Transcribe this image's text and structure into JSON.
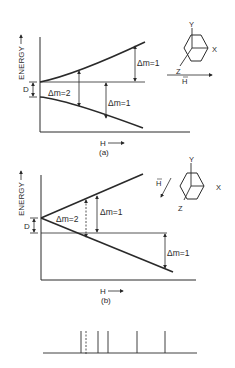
{
  "figure": {
    "panel_a": {
      "y_axis_label": "ENERGY",
      "x_axis_label": "H",
      "caption": "(a)",
      "splitting_label": "D",
      "transitions": [
        {
          "label": "Δm=2",
          "style": "solid"
        },
        {
          "label": "Δm=1",
          "style": "solid"
        },
        {
          "label": "Δm=1",
          "style": "solid"
        }
      ],
      "orientation": {
        "axes": [
          "Y",
          "X",
          "Z"
        ],
        "field_label": "H",
        "field_direction": "horizontal"
      }
    },
    "panel_b": {
      "y_axis_label": "ENERGY",
      "x_axis_label": "H",
      "caption": "(b)",
      "splitting_label": "D",
      "transitions": [
        {
          "label": "Δm=2",
          "style": "dashed"
        },
        {
          "label": "Δm=1",
          "style": "solid"
        },
        {
          "label": "Δm=1",
          "style": "solid"
        }
      ],
      "orientation": {
        "axes": [
          "Y",
          "X",
          "Z"
        ],
        "field_label": "H",
        "field_direction": "diagonal"
      }
    },
    "spectrum": {
      "lines": [
        {
          "position": 81,
          "style": "solid"
        },
        {
          "position": 86,
          "style": "dashed"
        },
        {
          "position": 98,
          "style": "solid"
        },
        {
          "position": 108,
          "style": "solid"
        },
        {
          "position": 137,
          "style": "solid"
        },
        {
          "position": 165,
          "style": "solid"
        }
      ]
    },
    "colors": {
      "ink": "#2a2a2a",
      "background": "#ffffff"
    }
  }
}
